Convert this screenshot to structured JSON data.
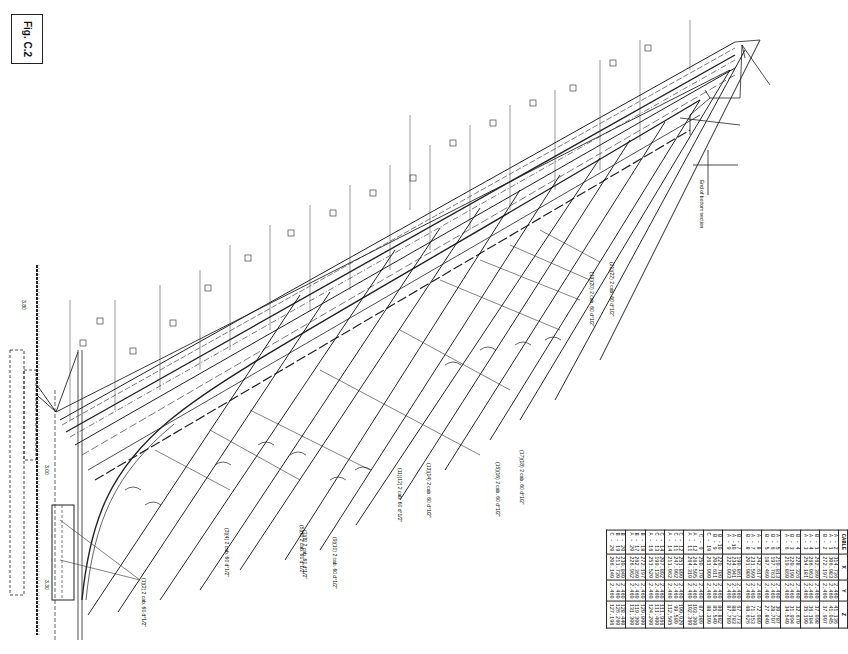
{
  "figure": {
    "label": "Fig. C.2"
  },
  "drawing": {
    "cable_labels": [
      "(1)(2) 2 cab. 60 d°1/2\"",
      "(3)(4) 2 cab. 60 d°1/2\"",
      "(5)(6) 2 cab. 60 d°1/2\"",
      "(7)(8) 2 cab. 60 d°1/2\"",
      "(9)(10) 2 cab. 60 d°1/2\"",
      "(11)(12) 2 cab. 60 d°1/2\"",
      "(13)(14) 2 cab. 60 d°1/2\"",
      "(15)(16) 2 cab. 60 d°1/2\"",
      "(17)(18) 2 cab. 60 d°1/2\"",
      "(19)(20) 2 cab. 60 d°1/2\"",
      "(21)(22) 2 cab. 60 d°1/2\""
    ],
    "section_markers": [
      "Connect. A",
      "Connect. B",
      "Connect. C",
      "Connect. D",
      "Connect. E",
      "Connect. F",
      "Connect. G",
      "Connect. H",
      "Connect. I",
      "Connect. J",
      "Connect. K",
      "Connect. L",
      "Connect. M"
    ],
    "annotations": {
      "end_bottom_section": "End of bottom section",
      "dim_top": "3.80",
      "dim_mid": "3.00",
      "dim_bottom": "3.30"
    }
  },
  "table": {
    "headers": [
      "CABLE",
      "X",
      "Y",
      "Z"
    ],
    "rows": [
      [
        "A - 2\nA - 1\nB - 2",
        "314.736\n306.983\n272.197",
        "2.460\n2.460\n2.460",
        "41.136\n41.045\n37.907"
      ],
      [
        "B - 1\nA - 4\nA - 3",
        "262.360\n266.063\n254.181",
        "2.460\n2.460\n2.460",
        "37.098\n36.184\n35.190"
      ],
      [
        "B - 4\nB - 3\nA - 6",
        "228.326\n220.190\n219.860",
        "2.460\n2.460\n2.460",
        "32.670\n31.994\n34.540"
      ],
      [
        "A - 5\nB - 6\nB - 5",
        "210.813\n197.763\n187.460",
        "2.460\n2.460\n2.460",
        "30.787\n28.707\n27.840"
      ],
      [
        "A - 8\nA - 7\nB - 8",
        "242.617\n231.509\n201.080",
        "2.460\n2.460\n2.460",
        "72.080\n71.153\n68.626"
      ],
      [
        "B - 7\nA -10\nA - 9",
        "190.861\n234.941\n222.003",
        "2.460\n2.460\n2.460",
        "67.773\n88.783\n87.789"
      ],
      [
        "B -10\nB - 9\nC - 10",
        "220.780\n204.611\n261.000",
        "2.460\n2.460\n2.460",
        "86.882\n85.540\n88.300"
      ],
      [
        "C - 9\nA - 12\nA - 11",
        "250.170\n264.505\n264.310",
        "2.460\n2.460\n2.460",
        "87.380\n103.300\n102.360"
      ],
      [
        "C - 12\nC - 11\nA - 14",
        "251.800\n247.002\n211.062",
        "2.460\n2.460\n2.460",
        "100.020\n99.580\n112.505"
      ],
      [
        "C - 14\nC - 13\nA - 16",
        "207.802\n199.130\n251.520",
        "2.460\n2.460\n2.460",
        "111.966\n111.400\n124.200"
      ],
      [
        "B - 18\nB - 17\nA - 20",
        "272.197\n262.360\n226.962",
        "2.460\n2.460\n2.460",
        "120.800\n119.300\n131.300"
      ],
      [
        "B - 20\nB - 19\nC - 20",
        "230.840\n211.730\n206.140",
        "2.460\n2.460\n2.460",
        "128.440\n126.260\n127.196"
      ]
    ]
  }
}
